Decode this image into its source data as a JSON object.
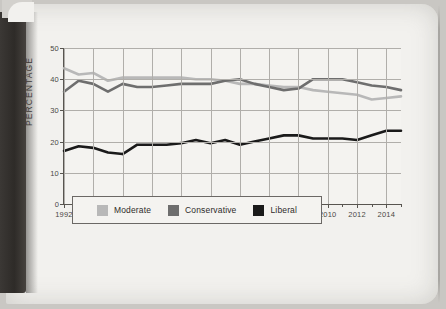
{
  "page": {
    "kind": "scanned-book-page"
  },
  "chart_data": {
    "type": "line",
    "title": "",
    "xlabel": "",
    "ylabel": "PERCENTAGE",
    "xlim": [
      1992,
      2015
    ],
    "ylim": [
      0,
      50
    ],
    "grid": true,
    "legend_position": "bottom",
    "y_ticks": [
      0,
      10,
      20,
      30,
      40,
      50
    ],
    "x_ticks": [
      1992,
      1994,
      1996,
      1998,
      2000,
      2002,
      2004,
      2006,
      2008,
      2010,
      2012,
      2014
    ],
    "x": [
      1992,
      1993,
      1994,
      1995,
      1996,
      1997,
      1998,
      1999,
      2000,
      2001,
      2002,
      2003,
      2004,
      2005,
      2006,
      2007,
      2008,
      2009,
      2010,
      2011,
      2012,
      2013,
      2014,
      2015
    ],
    "series": [
      {
        "name": "Moderate",
        "color": "#b8b8b8",
        "values": [
          43.5,
          41.5,
          42.0,
          39.5,
          40.5,
          40.5,
          40.5,
          40.5,
          40.5,
          40.0,
          40.0,
          39.5,
          38.5,
          38.5,
          38.0,
          37.5,
          37.5,
          36.5,
          36.0,
          35.5,
          35.0,
          33.5,
          34.0,
          34.5
        ]
      },
      {
        "name": "Conservative",
        "color": "#6e6e6e",
        "values": [
          36.0,
          39.5,
          38.5,
          36.0,
          38.5,
          37.5,
          37.5,
          38.0,
          38.5,
          38.5,
          38.5,
          39.5,
          40.0,
          38.5,
          37.5,
          36.5,
          37.0,
          40.0,
          40.0,
          40.0,
          39.0,
          38.0,
          37.5,
          36.5
        ]
      },
      {
        "name": "Liberal",
        "color": "#1a1a1a",
        "values": [
          17.0,
          18.5,
          18.0,
          16.5,
          16.0,
          19.0,
          19.0,
          19.0,
          19.5,
          20.5,
          19.5,
          20.5,
          19.0,
          20.0,
          21.0,
          22.0,
          22.0,
          21.0,
          21.0,
          21.0,
          20.5,
          22.0,
          23.5,
          23.5
        ]
      }
    ]
  },
  "legend": {
    "items": [
      {
        "label": "Moderate",
        "color": "#b8b8b8"
      },
      {
        "label": "Conservative",
        "color": "#6e6e6e"
      },
      {
        "label": "Liberal",
        "color": "#1a1a1a"
      }
    ]
  }
}
